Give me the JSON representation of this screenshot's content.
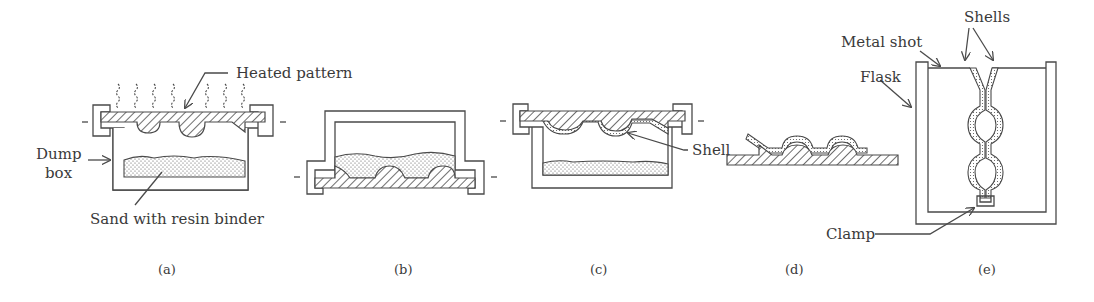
{
  "figure": {
    "panels": [
      {
        "id": "a",
        "caption": "(a)",
        "labels": {
          "heated_pattern": "Heated pattern",
          "dump_box_line1": "Dump",
          "dump_box_line2": "box",
          "sand": "Sand with resin binder"
        }
      },
      {
        "id": "b",
        "caption": "(b)",
        "labels": {}
      },
      {
        "id": "c",
        "caption": "(c)",
        "labels": {
          "shell": "Shell"
        }
      },
      {
        "id": "d",
        "caption": "(d)",
        "labels": {}
      },
      {
        "id": "e",
        "caption": "(e)",
        "labels": {
          "metal_shot": "Metal shot",
          "flask": "Flask",
          "shells": "Shells",
          "clamp": "Clamp"
        }
      }
    ]
  },
  "colors": {
    "line": "#4a4a4a",
    "text": "#3a3a3a",
    "background": "#ffffff"
  }
}
